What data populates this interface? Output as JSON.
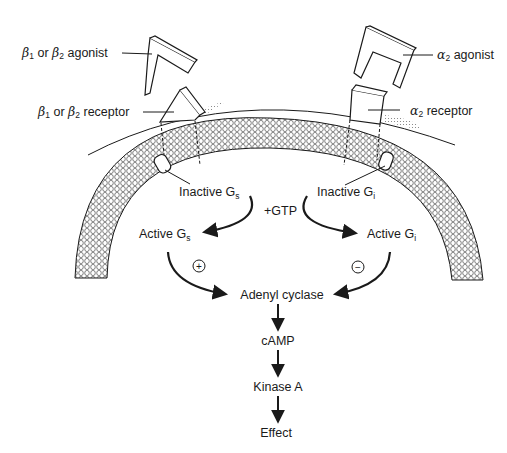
{
  "diagram": {
    "colors": {
      "ink": "#1a1a1a",
      "background": "#ffffff",
      "stipple": "#888888"
    },
    "labels": {
      "beta_agonist": {
        "greek1": "β",
        "sub1": "1",
        "mid": " or ",
        "greek2": "β",
        "sub2": "2",
        "tail": " agonist"
      },
      "beta_receptor": {
        "greek1": "β",
        "sub1": "1",
        "mid": " or ",
        "greek2": "β",
        "sub2": "2",
        "tail": " receptor"
      },
      "alpha_agonist": {
        "greek": "α",
        "sub": "2",
        "tail": " agonist"
      },
      "alpha_receptor": {
        "greek": "α",
        "sub": "2",
        "tail": " receptor"
      },
      "inactive_gs": {
        "main": "Inactive G",
        "sub": "s"
      },
      "inactive_gi": {
        "main": "Inactive G",
        "sub": "i"
      },
      "gtp": "+GTP",
      "active_gs": {
        "main": "Active G",
        "sub": "s"
      },
      "active_gi": {
        "main": "Active G",
        "sub": "i"
      },
      "stimulate_sign": "+",
      "inhibit_sign": "−",
      "adenyl_cyclase": "Adenyl cyclase",
      "camp": "cAMP",
      "kinase_a": "Kinase A",
      "effect": "Effect"
    },
    "cascade": [
      "Adenyl cyclase",
      "cAMP",
      "Kinase A",
      "Effect"
    ]
  }
}
